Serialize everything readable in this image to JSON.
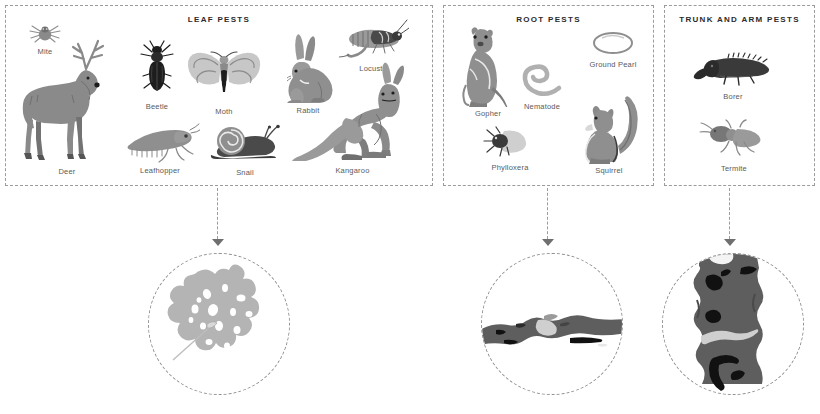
{
  "diagram": {
    "colors": {
      "panel_border": "#9b9b9b",
      "title_text": "#2b2b2b",
      "label_text": "#5a5a5a",
      "arrow": "#6f6f6f",
      "mid_gray": "#8a8a8a",
      "light_gray": "#b3b3b3",
      "dark_gray": "#4a4a4a",
      "near_black": "#222222",
      "pale_gray": "#d0d0d0"
    }
  },
  "panels": [
    {
      "id": "leaf",
      "title": "LEAF PESTS",
      "pests": [
        {
          "name": "Mite",
          "icon": "mite-icon"
        },
        {
          "name": "Deer",
          "icon": "deer-icon"
        },
        {
          "name": "Beetle",
          "icon": "beetle-icon"
        },
        {
          "name": "Moth",
          "icon": "moth-icon"
        },
        {
          "name": "Rabbit",
          "icon": "rabbit-icon"
        },
        {
          "name": "Locust",
          "icon": "locust-icon"
        },
        {
          "name": "Leafhopper",
          "icon": "leafhopper-icon"
        },
        {
          "name": "Snail",
          "icon": "snail-icon"
        },
        {
          "name": "Kangaroo",
          "icon": "kangaroo-icon"
        }
      ],
      "result": {
        "name": "damaged-leaf",
        "description": "Leaf riddled with feeding holes"
      }
    },
    {
      "id": "root",
      "title": "ROOT PESTS",
      "pests": [
        {
          "name": "Gopher",
          "icon": "gopher-icon"
        },
        {
          "name": "Nematode",
          "icon": "nematode-icon"
        },
        {
          "name": "Ground Pearl",
          "icon": "ground-pearl-icon"
        },
        {
          "name": "Phylloxera",
          "icon": "phylloxera-icon"
        },
        {
          "name": "Squirrel",
          "icon": "squirrel-icon"
        }
      ],
      "result": {
        "name": "damaged-root",
        "description": "Root with chewed and stripped bark"
      }
    },
    {
      "id": "trunk",
      "title": "TRUNK AND ARM PESTS",
      "pests": [
        {
          "name": "Borer",
          "icon": "borer-icon"
        },
        {
          "name": "Termite",
          "icon": "termite-icon"
        }
      ],
      "result": {
        "name": "damaged-trunk",
        "description": "Trunk with bore holes and galleries"
      }
    }
  ]
}
